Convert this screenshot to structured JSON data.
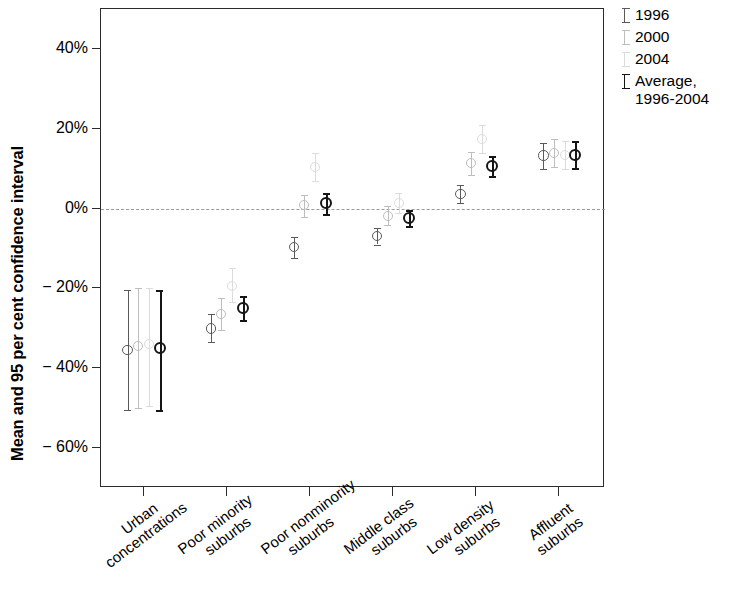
{
  "chart_data": {
    "type": "scatter",
    "title": "",
    "xlabel": "",
    "ylabel": "Mean and 95 per cent confidence interval",
    "ylim": [
      -70,
      50
    ],
    "yticks": [
      40,
      20,
      0,
      -20,
      -40,
      -60
    ],
    "ytick_labels": [
      "40%",
      "20%",
      "0%",
      "− 20%",
      "− 40%",
      "− 60%"
    ],
    "grid": false,
    "zero_reference_line": true,
    "legend_position": "top-right",
    "categories": [
      "Urban\nconcentrations",
      "Poor minority\nsuburbs",
      "Poor nonminority\nsuburbs",
      "Middle class\nsuburbs",
      "Low density\nsuburbs",
      "Affluent\nsuburbs"
    ],
    "series": [
      {
        "name": "1996",
        "color": "#5a5a5a",
        "values": [
          -35.5,
          -30.0,
          -9.7,
          -6.9,
          3.6,
          13.3
        ],
        "ci_low": [
          -50.5,
          -33.5,
          -12.5,
          -9.0,
          1.3,
          10.0
        ],
        "ci_high": [
          -20.5,
          -26.5,
          -7.0,
          -4.8,
          6.0,
          16.5
        ]
      },
      {
        "name": "2000",
        "color": "#bdbdbd",
        "values": [
          -34.5,
          -26.5,
          0.8,
          -1.8,
          11.4,
          14.0
        ],
        "ci_low": [
          -50.0,
          -30.5,
          -2.0,
          -4.0,
          8.5,
          10.5
        ],
        "ci_high": [
          -20.0,
          -22.5,
          3.5,
          0.6,
          14.2,
          17.5
        ]
      },
      {
        "name": "2004",
        "color": "#dcdcdc",
        "values": [
          -34.0,
          -19.3,
          10.4,
          1.3,
          17.5,
          13.5
        ],
        "ci_low": [
          -49.5,
          -23.5,
          7.0,
          -1.2,
          14.0,
          10.0
        ],
        "ci_high": [
          -19.8,
          -15.0,
          13.8,
          3.8,
          21.0,
          17.0
        ]
      },
      {
        "name": "Average,\n1996-2004",
        "color": "#151515",
        "values": [
          -35.0,
          -25.0,
          1.3,
          -2.3,
          10.7,
          13.5
        ],
        "ci_low": [
          -50.5,
          -28.0,
          -1.3,
          -4.3,
          8.2,
          10.2
        ],
        "ci_high": [
          -20.5,
          -22.0,
          3.8,
          -0.4,
          13.2,
          17.0
        ]
      }
    ]
  },
  "legend": {
    "entries": [
      {
        "label": "1996"
      },
      {
        "label": "2000"
      },
      {
        "label": "2004"
      },
      {
        "label": "Average,\n1996-2004"
      }
    ]
  },
  "axis": {
    "y_title": "Mean and 95 per cent confidence interval"
  }
}
